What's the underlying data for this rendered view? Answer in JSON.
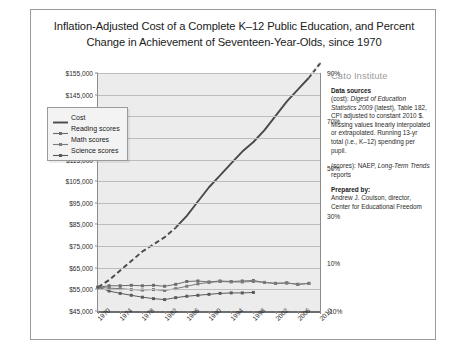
{
  "chart_data": {
    "type": "line",
    "title": "Inflation-Adjusted Cost of a Complete K–12 Public Education, and Percent Change in Achievement of Seventeen-Year-Olds, since 1970",
    "xlabel": "",
    "ylabel": "",
    "ylim": [
      45000,
      155000
    ],
    "y2lim": [
      -10,
      90
    ],
    "grid": true,
    "legend_position": "inside-upper-left",
    "x": [
      1970,
      1972,
      1974,
      1976,
      1978,
      1980,
      1982,
      1984,
      1986,
      1988,
      1990,
      1992,
      1994,
      1996,
      1998,
      2000,
      2002,
      2004,
      2006,
      2008,
      2010
    ],
    "y_ticks": [
      "$45,000",
      "$55,000",
      "$65,000",
      "$75,000",
      "$85,000",
      "$95,000",
      "$105,000",
      "$115,000",
      "$125,000",
      "$135,000",
      "$145,000",
      "$155,000"
    ],
    "y2_ticks": [
      "-10%",
      "10%",
      "30%",
      "50%",
      "70%",
      "90%"
    ],
    "x_ticks": [
      "1970",
      "1974",
      "1978",
      "1982",
      "1986",
      "1990",
      "1994",
      "1998",
      "2002",
      "2006",
      "2010"
    ],
    "series": [
      {
        "name": "Cost",
        "color": "#4a4a4a",
        "marker": "none",
        "values_percent": [
          0,
          3,
          7,
          11,
          15,
          18,
          21,
          25,
          30,
          36,
          42,
          47,
          52,
          57,
          61,
          66,
          72,
          78,
          83,
          88,
          94
        ]
      },
      {
        "name": "Reading scores",
        "color": "#6b6b6b",
        "marker": "square",
        "values_percent": [
          0,
          0.6,
          0.6,
          0.8,
          0.6,
          0.8,
          0.4,
          1.2,
          2.4,
          2.6,
          2.2,
          2.6,
          2.4,
          2.6,
          2.8,
          2.0,
          1.6,
          1.8,
          1.2,
          1.6,
          null
        ]
      },
      {
        "name": "Math scores",
        "color": "#7a7a7a",
        "marker": "square",
        "values_percent": [
          0,
          -0.4,
          -0.6,
          -1.0,
          -1.2,
          -1.0,
          -1.4,
          -0.6,
          0.4,
          1.4,
          2.0,
          2.4,
          2.2,
          2.2,
          2.4,
          2.0,
          1.6,
          1.8,
          1.2,
          1.6,
          null
        ]
      },
      {
        "name": "Science scores",
        "color": "#5a5a5a",
        "marker": "square",
        "values_percent": [
          0,
          -1.6,
          -2.6,
          -3.4,
          -4.2,
          -4.8,
          -5.2,
          -4.4,
          -3.8,
          -3.4,
          -3.0,
          -2.6,
          -2.4,
          -2.4,
          -2.2,
          null,
          null,
          null,
          null,
          null,
          null
        ]
      }
    ]
  },
  "legend": {
    "items": [
      {
        "label": "Cost"
      },
      {
        "label": "Reading scores"
      },
      {
        "label": "Math scores"
      },
      {
        "label": "Science scores"
      }
    ]
  },
  "side_panel": {
    "org": "Cato Institute",
    "data_sources_heading": "Data sources",
    "cost_source_prefix": "(cost): ",
    "cost_source_italic": "Digest of Education Statistics 2009",
    "cost_source_rest": " (latest), Table 182, CPI adjusted to constant 2010 $.   Missing values linearly interpolated or extrapolated. Running 13-yr total (i.e., K–12) spending per pupil.",
    "scores_source_prefix": "(scores): NAEP, ",
    "scores_source_italic": "Long-Term Trends",
    "scores_source_rest": " reports",
    "prepared_by_heading": "Prepared by:",
    "prepared_by_body": "Andrew J. Coulson, director, Center for Educational Freedom"
  }
}
